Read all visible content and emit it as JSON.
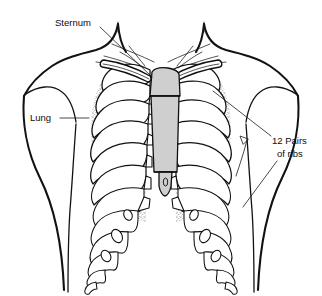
{
  "figure": {
    "background_color": "#ffffff",
    "line_color": "#101010",
    "sternum_fill": "#cfcfcf",
    "lung_fill_pattern": "stipple",
    "width": 322,
    "height": 296
  },
  "labels": {
    "sternum": {
      "text": "Sternum",
      "x": 55,
      "y": 22,
      "leader_from": [
        100,
        26
      ],
      "leader_to": [
        152,
        76
      ]
    },
    "lung": {
      "text": "Lung",
      "x": 32,
      "y": 118,
      "leader_from": [
        62,
        118
      ],
      "leader_to": [
        88,
        118
      ]
    },
    "ribs_line1": {
      "text": "12 Pairs",
      "x": 274,
      "y": 140
    },
    "ribs_line2": {
      "text": "of ribs",
      "x": 278,
      "y": 153
    },
    "ribs_leader_upper": {
      "from": [
        272,
        136
      ],
      "to": [
        214,
        92
      ]
    },
    "ribs_leader_lower": {
      "from": [
        276,
        160
      ],
      "to": [
        240,
        205
      ]
    }
  },
  "structures": [
    {
      "name": "sternum",
      "parts": [
        "manubrium",
        "body",
        "xiphoid-process"
      ],
      "fill": "#cfcfcf"
    },
    {
      "name": "ribs",
      "count_pairs": 12,
      "fill": "#ffffff"
    },
    {
      "name": "lungs",
      "sides": [
        "left",
        "right"
      ],
      "texture": "stipple"
    },
    {
      "name": "clavicle",
      "sides": [
        "left",
        "right"
      ]
    },
    {
      "name": "torso-outline",
      "features": [
        "neck",
        "shoulders",
        "chest",
        "arms"
      ]
    }
  ]
}
